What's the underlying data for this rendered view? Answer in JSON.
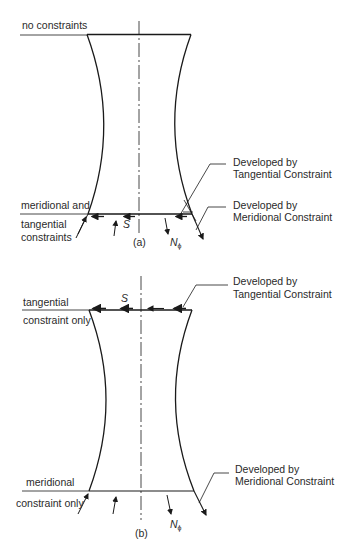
{
  "figure": {
    "panel_a": {
      "caption": "(a)",
      "top_label": "no constraints",
      "bottom_label_line1": "meridional and",
      "bottom_label_line2": "tangential",
      "bottom_label_line3": "constraints",
      "shear_symbol": "S",
      "normal_symbol": "N",
      "normal_subscript": "ϕ",
      "callout_tangential_line1": "Developed by",
      "callout_tangential_line2": "Tangential Constraint",
      "callout_meridional_line1": "Developed by",
      "callout_meridional_line2": "Meridional Constraint"
    },
    "panel_b": {
      "caption": "(b)",
      "top_label_line1": "tangential",
      "top_label_line2": "constraint only",
      "bottom_label_line1": "meridional",
      "bottom_label_line2": "constraint only",
      "shear_symbol": "S",
      "normal_symbol": "N",
      "normal_subscript": "ϕ",
      "callout_tangential_line1": "Developed by",
      "callout_tangential_line2": "Tangential Constraint",
      "callout_meridional_line1": "Developed by",
      "callout_meridional_line2": "Meridional Constraint"
    },
    "colors": {
      "ink": "#1a1a1a",
      "background": "#ffffff"
    }
  }
}
